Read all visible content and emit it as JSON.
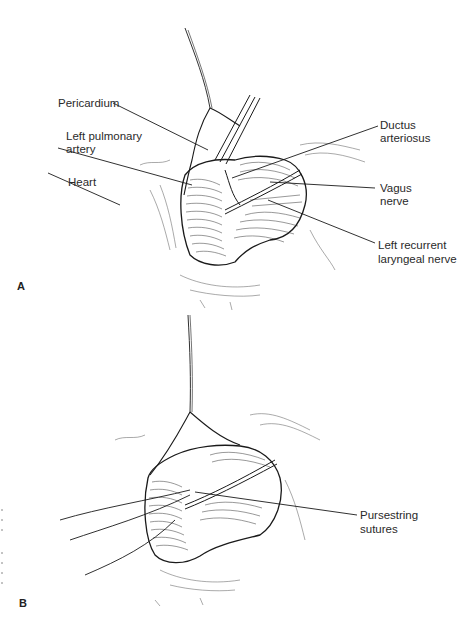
{
  "figure": {
    "panels": [
      {
        "id": "A",
        "letter": "A",
        "labels": {
          "pericardium": "Pericardium",
          "left_pulmonary_artery_1": "Left pulmonary",
          "left_pulmonary_artery_2": "artery",
          "heart": "Heart",
          "ductus_arteriosus_1": "Ductus",
          "ductus_arteriosus_2": "arteriosus",
          "vagus_nerve_1": "Vagus",
          "vagus_nerve_2": "nerve",
          "left_recurrent_laryngeal_nerve_1": "Left recurrent",
          "left_recurrent_laryngeal_nerve_2": "laryngeal nerve"
        }
      },
      {
        "id": "B",
        "letter": "B",
        "labels": {
          "pursestring_sutures_1": "Pursestring",
          "pursestring_sutures_2": "sutures"
        }
      }
    ]
  }
}
